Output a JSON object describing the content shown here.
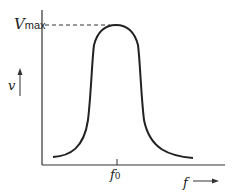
{
  "diagram": {
    "y_axis": {
      "label": "v",
      "arrow": "up"
    },
    "x_axis": {
      "label": "f",
      "arrow": "right"
    },
    "peak_label": {
      "main": "V",
      "sub": "max"
    },
    "center_label": {
      "main": "f",
      "sub": "0"
    },
    "line_color": "#222222"
  }
}
